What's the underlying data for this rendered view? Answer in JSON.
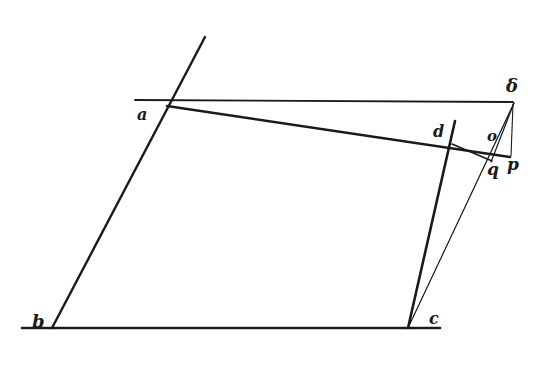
{
  "figure": {
    "labels": {
      "a": "a",
      "b": "b",
      "c": "c",
      "d": "d",
      "delta": "δ",
      "o": "o",
      "p": "p",
      "q": "q"
    }
  }
}
